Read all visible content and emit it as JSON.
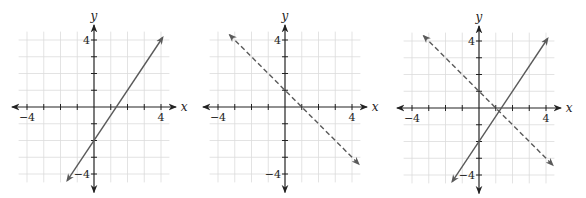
{
  "chart_data": [
    {
      "type": "line",
      "title": "",
      "xlabel": "x",
      "ylabel": "y",
      "xlim": [
        -4.5,
        4.5
      ],
      "ylim": [
        -4.5,
        4.5
      ],
      "grid": true,
      "tick_labels": {
        "x": [
          "-4",
          "4"
        ],
        "y": [
          "4",
          "-4"
        ]
      },
      "series": [
        {
          "name": "line-1",
          "equation": "y = 1.5x - 2",
          "style": "solid",
          "color": "#5a5a5a",
          "points": [
            [
              -1.6,
              -4.4
            ],
            [
              0,
              -2
            ],
            [
              1.33,
              0
            ],
            [
              4.1,
              4.15
            ]
          ]
        }
      ]
    },
    {
      "type": "line",
      "title": "",
      "xlabel": "x",
      "ylabel": "y",
      "xlim": [
        -4.5,
        4.5
      ],
      "ylim": [
        -4.5,
        4.5
      ],
      "grid": true,
      "tick_labels": {
        "x": [
          "-4",
          "4"
        ],
        "y": [
          "4",
          "-4"
        ]
      },
      "series": [
        {
          "name": "line-2",
          "equation": "y = -x + 1",
          "style": "dashed",
          "color": "#5a5a5a",
          "points": [
            [
              -3.3,
              4.3
            ],
            [
              0,
              1
            ],
            [
              1,
              0
            ],
            [
              4.4,
              -3.4
            ]
          ]
        }
      ]
    },
    {
      "type": "line",
      "title": "",
      "xlabel": "x",
      "ylabel": "y",
      "xlim": [
        -4.5,
        4.5
      ],
      "ylim": [
        -4.5,
        4.5
      ],
      "grid": true,
      "tick_labels": {
        "x": [
          "-4",
          "4"
        ],
        "y": [
          "4",
          "-4"
        ]
      },
      "series": [
        {
          "name": "line-1",
          "equation": "y = 1.5x - 2",
          "style": "solid",
          "color": "#5a5a5a",
          "points": [
            [
              -1.6,
              -4.4
            ],
            [
              0,
              -2
            ],
            [
              1.33,
              0
            ],
            [
              4.1,
              4.15
            ]
          ]
        },
        {
          "name": "line-2",
          "equation": "y = -x + 1",
          "style": "dashed",
          "color": "#5a5a5a",
          "points": [
            [
              -3.3,
              4.3
            ],
            [
              0,
              1
            ],
            [
              1,
              0
            ],
            [
              4.4,
              -3.4
            ]
          ]
        }
      ],
      "intersection": [
        1.2,
        -0.8
      ]
    }
  ],
  "graphs": [
    {
      "left": 0,
      "ox": 94,
      "oy": 107,
      "x_label": "x",
      "y_label": "y",
      "xneg": "−4",
      "xpos": "4",
      "ypos": "4",
      "yneg": "−4"
    },
    {
      "left": 191,
      "ox": 94,
      "oy": 107,
      "x_label": "x",
      "y_label": "y",
      "xneg": "−4",
      "xpos": "4",
      "ypos": "4",
      "yneg": "−4"
    },
    {
      "left": 385,
      "ox": 94,
      "oy": 108,
      "x_label": "x",
      "y_label": "y",
      "xneg": "−4",
      "xpos": "4",
      "ypos": "4",
      "yneg": "−4"
    }
  ],
  "style": {
    "unit_px": 16.75,
    "line_color": "#5a5a5a",
    "axis_color": "#222222",
    "grid_color": "#dcdcdc"
  }
}
